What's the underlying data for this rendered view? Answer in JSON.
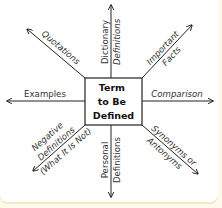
{
  "diagram": {
    "type": "concept-map",
    "center": {
      "lines": [
        "Term",
        "to Be",
        "Defined"
      ]
    },
    "branches": [
      {
        "id": "quotations",
        "direction": "upper-left",
        "lines": [
          "Quotations"
        ]
      },
      {
        "id": "dictionary-definitions",
        "direction": "up",
        "lines": [
          "Dictionary",
          "Definitions"
        ]
      },
      {
        "id": "important-facts",
        "direction": "upper-right",
        "lines": [
          "Important",
          "Facts"
        ]
      },
      {
        "id": "examples",
        "direction": "left",
        "lines": [
          "Examples"
        ]
      },
      {
        "id": "comparison",
        "direction": "right",
        "lines": [
          "Comparison"
        ]
      },
      {
        "id": "negative-definitions",
        "direction": "lower-left",
        "lines": [
          "Negative",
          "Definitions",
          "(What It Is Not)"
        ]
      },
      {
        "id": "personal-definitions",
        "direction": "down",
        "lines": [
          "Personal",
          "Definitions"
        ]
      },
      {
        "id": "synonyms-antonyms",
        "direction": "lower-right",
        "lines": [
          "Synonyms or",
          "Antonyms"
        ]
      }
    ],
    "colors": {
      "line": "#222222",
      "text": "#333333",
      "background": "#ffffff",
      "border": "#f3e9c6"
    }
  }
}
